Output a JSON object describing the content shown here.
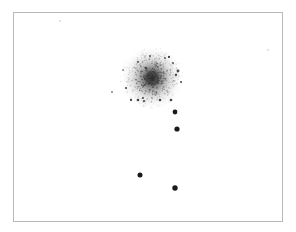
{
  "image": {
    "description": "Negative (inverted) astronomical plate of a star cluster with nearby foreground stars",
    "background_color": "#ffffff",
    "border_color": "#b8b8b8",
    "ink_color": "#1a1a1a",
    "cluster": {
      "center": [
        152,
        78
      ],
      "radius": 32,
      "core_radius": 12
    },
    "stars": [
      {
        "x": 175,
        "y": 112,
        "r": 2.4
      },
      {
        "x": 177,
        "y": 129,
        "r": 2.6
      },
      {
        "x": 140,
        "y": 175,
        "r": 2.5
      },
      {
        "x": 175,
        "y": 188,
        "r": 2.7
      }
    ],
    "faint_specks": [
      {
        "x": 60,
        "y": 21
      },
      {
        "x": 112,
        "y": 92
      },
      {
        "x": 268,
        "y": 50
      }
    ]
  }
}
